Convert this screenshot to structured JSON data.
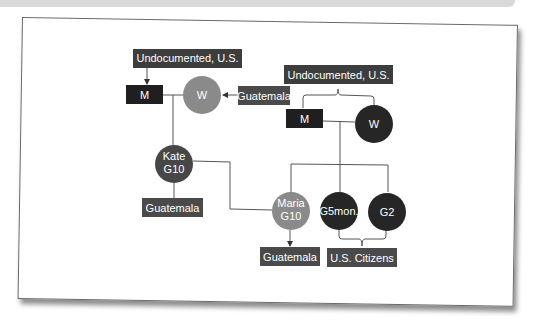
{
  "colors": {
    "box_dark": "#3d3d3d",
    "box_black": "#1f1f1f",
    "circle_grey": "#8a8a8a",
    "circle_dark": "#262626",
    "circle_mid": "#474747",
    "line": "#555555",
    "label_text": "#ffffff"
  },
  "diagram": {
    "left_family": {
      "status_label": "Undocumented, U.S.",
      "man": "M",
      "woman": "W",
      "woman_origin": "Guatemala",
      "child_name": "Kate",
      "child_gen": "G10",
      "child_origin": "Guatemala"
    },
    "right_family": {
      "status_label": "Undocumented, U.S.",
      "man": "M",
      "woman": "W",
      "children": [
        {
          "name": "Maria",
          "gen": "G10",
          "origin": "Guatemala"
        },
        {
          "name": "",
          "gen": "G5mon."
        },
        {
          "name": "",
          "gen": "G2"
        }
      ],
      "citizens_label": "U.S. Citizens"
    }
  }
}
